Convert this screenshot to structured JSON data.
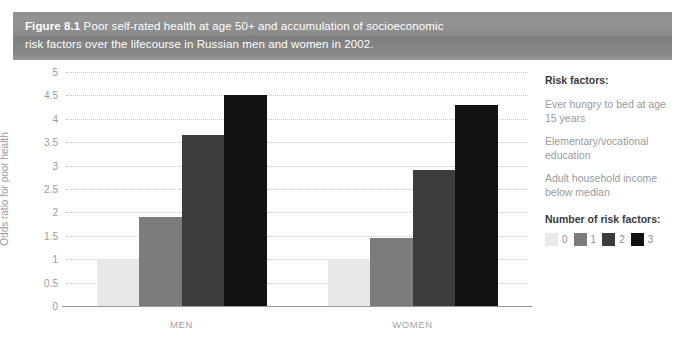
{
  "figure": {
    "label": "Figure 8.1",
    "caption": " Poor self-rated health at age 50+ and accumulation of socioeconomic\nrisk factors over the lifecourse in Russian men and women in 2002."
  },
  "side_panel": {
    "risk_factors_heading": "Risk factors:",
    "risk_factors": [
      "Ever hungry to bed at age 15 years",
      "Elementary/vocational education",
      "Adult household income below median"
    ],
    "legend_heading": "Number of risk factors:",
    "legend": [
      {
        "label": "0",
        "color": "#eaeaea"
      },
      {
        "label": "1",
        "color": "#7c7c7c"
      },
      {
        "label": "2",
        "color": "#3c3c3c"
      },
      {
        "label": "3",
        "color": "#121212"
      }
    ]
  },
  "chart_data": {
    "type": "bar",
    "title": "Poor self-rated health at age 50+ and accumulation of socioeconomic risk factors over the lifecourse in Russian men and women in 2002.",
    "xlabel": "",
    "ylabel": "Odds ratio for poor health",
    "ylim": [
      0,
      5
    ],
    "ytick_labels": [
      "0",
      "0.5",
      "1",
      "1.5",
      "2",
      "2.5",
      "3",
      "3.5",
      "4",
      "4.5",
      "5"
    ],
    "ytick_values": [
      0,
      0.5,
      1,
      1.5,
      2,
      2.5,
      3,
      3.5,
      4,
      4.5,
      5
    ],
    "grid": true,
    "legend_position": "right",
    "categories": [
      "MEN",
      "WOMEN"
    ],
    "series": [
      {
        "name": "0",
        "color": "#e8e8e8",
        "values": [
          1.0,
          1.0
        ]
      },
      {
        "name": "1",
        "color": "#7c7c7c",
        "values": [
          1.9,
          1.45
        ]
      },
      {
        "name": "2",
        "color": "#3c3c3c",
        "values": [
          3.65,
          2.9
        ]
      },
      {
        "name": "3",
        "color": "#121212",
        "values": [
          4.5,
          4.3
        ]
      }
    ]
  }
}
